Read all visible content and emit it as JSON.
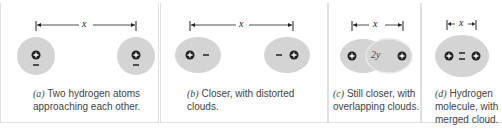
{
  "colors": {
    "cloud": "#d4d4d4",
    "cloud_edge": "#e6e6e6",
    "ink": "#222222",
    "caption": "#444444",
    "border": "#e0e0e0"
  },
  "distance_label": "x",
  "overlap_label": "2y",
  "panels": [
    {
      "id": "a",
      "label": "(a)",
      "caption": "Two hydrogen atoms approaching each other."
    },
    {
      "id": "b",
      "label": "(b)",
      "caption": "Closer, with distorted clouds."
    },
    {
      "id": "c",
      "label": "(c)",
      "caption": "Still closer, with overlapping clouds."
    },
    {
      "id": "d",
      "label": "(d)",
      "caption": "Hydrogen molecule, with merged cloud."
    }
  ],
  "symbols": {
    "proton": "+",
    "electron": "−"
  }
}
